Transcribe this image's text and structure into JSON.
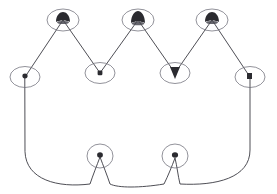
{
  "figure": {
    "background_color": "#ffffff",
    "contour_color": "#3a3a42",
    "marker_ring_color": "#6e6e78",
    "marker_blob_color": "#2b2b30",
    "width": 277,
    "height": 194,
    "vertex_count": 9,
    "stroke_width": 0.9
  },
  "chart_data": {
    "type": "scatter",
    "xlabel": "",
    "ylabel": "",
    "xlim": [
      0,
      277
    ],
    "ylim": [
      194,
      0
    ],
    "grid": false,
    "legend_position": "none",
    "annotations": [],
    "vertices": [
      {
        "id": "v1",
        "role": "left-shoulder",
        "x": 25,
        "y": 77,
        "rx": 15,
        "ry": 10.5,
        "blob": "dot"
      },
      {
        "id": "v2",
        "role": "peak-left",
        "x": 63,
        "y": 20,
        "rx": 16,
        "ry": 11,
        "blob": "wide"
      },
      {
        "id": "v3",
        "role": "valley-left",
        "x": 100,
        "y": 73,
        "rx": 15,
        "ry": 10.5,
        "blob": "dot"
      },
      {
        "id": "v4",
        "role": "peak-center",
        "x": 138,
        "y": 20,
        "rx": 16,
        "ry": 11,
        "blob": "wide"
      },
      {
        "id": "v5",
        "role": "valley-right",
        "x": 175,
        "y": 73,
        "rx": 15,
        "ry": 10.5,
        "blob": "vee"
      },
      {
        "id": "v6",
        "role": "peak-right",
        "x": 212,
        "y": 20,
        "rx": 16,
        "ry": 11,
        "blob": "wide"
      },
      {
        "id": "v7",
        "role": "right-shoulder",
        "x": 250,
        "y": 77,
        "rx": 15,
        "ry": 10.5,
        "blob": "dot"
      },
      {
        "id": "v8",
        "role": "bottom-right",
        "x": 175,
        "y": 156,
        "rx": 13,
        "ry": 12,
        "blob": "dot"
      },
      {
        "id": "v9",
        "role": "bottom-left",
        "x": 100,
        "y": 156,
        "rx": 13,
        "ry": 12,
        "blob": "dot"
      }
    ],
    "segments": [
      {
        "from": "v1",
        "to": "v2",
        "shape": "line"
      },
      {
        "from": "v2",
        "to": "v3",
        "shape": "line"
      },
      {
        "from": "v3",
        "to": "v4",
        "shape": "line"
      },
      {
        "from": "v4",
        "to": "v5",
        "shape": "line"
      },
      {
        "from": "v5",
        "to": "v6",
        "shape": "line"
      },
      {
        "from": "v6",
        "to": "v7",
        "shape": "line"
      },
      {
        "from": "v7",
        "to": "v8",
        "shape": "arc-convex-right"
      },
      {
        "from": "v8",
        "to": "v9",
        "shape": "arc-scallop"
      },
      {
        "from": "v9",
        "to": "v1",
        "shape": "arc-convex-left"
      }
    ],
    "contour_path": "M 25 77 L 63 20 L 100 73 L 138 20 L 175 73 L 212 20 L 250 77 L 250 150 C 250 178 216 186 180 184 C 178 176 177 166 175 158 C 172 166 168 176 164 184 C 140 188 118 188 110 184 C 107 175 103 165 100 157 C 97 165 93 175 90 184 C 58 188 26 180 25 152 Z"
  }
}
